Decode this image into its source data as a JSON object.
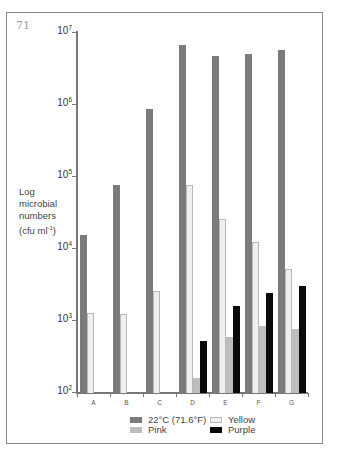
{
  "figure": {
    "number": "71",
    "ylabel_lines": [
      "Log",
      "microbial",
      "numbers",
      "(cfu ml",
      "-1",
      ")"
    ]
  },
  "colors": {
    "gray": "#7b7b7b",
    "pink": "#bdbdbd",
    "yellow": "#efefef",
    "yellow_border": "#b8b8b8",
    "purple": "#0a0a0a"
  },
  "chart_data": {
    "type": "bar",
    "title": "",
    "xlabel": "",
    "ylabel": "Log microbial numbers (cfu ml-1)",
    "yscale": "log",
    "ylim": [
      100,
      10000000
    ],
    "yticks": [
      "10^2",
      "10^3",
      "10^4",
      "10^5",
      "10^6",
      "10^7"
    ],
    "categories": [
      "A",
      "B",
      "C",
      "D",
      "E",
      "F",
      "G"
    ],
    "series": [
      {
        "name": "22°C (71.6°F)",
        "values": [
          15000,
          75000,
          850000,
          6600000,
          4600000,
          4900000,
          5600000
        ]
      },
      {
        "name": "Yellow",
        "values": [
          1250,
          1200,
          2500,
          75000,
          25000,
          12000,
          5100
        ]
      },
      {
        "name": "Pink",
        "values": [
          null,
          null,
          null,
          155,
          580,
          830,
          750
        ]
      },
      {
        "name": "Purple",
        "values": [
          null,
          null,
          null,
          510,
          1550,
          2350,
          2950
        ]
      }
    ],
    "legend": {
      "position": "bottom",
      "entries": [
        "22°C (71.6°F)",
        "Yellow",
        "Pink",
        "Purple"
      ]
    },
    "grid": false
  },
  "legend": {
    "gray": "22°C (71.6°F)",
    "yellow": "Yellow",
    "pink": "Pink",
    "purple": "Purple"
  },
  "axis": {
    "y_base": "10",
    "y_exponents": [
      "7",
      "6",
      "5",
      "4",
      "3",
      "2"
    ],
    "x_labels": [
      "A",
      "B",
      "C",
      "D",
      "E",
      "F",
      "G"
    ]
  }
}
